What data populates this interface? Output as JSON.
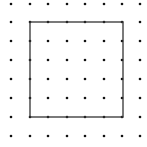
{
  "diagram": {
    "type": "dot-grid-with-square",
    "background": "#ffffff",
    "dot_color": "#111111",
    "line_color": "#333333",
    "grid": {
      "columns_x": [
        11,
        30,
        48,
        67,
        85,
        104,
        122,
        140
      ],
      "rows_y": [
        4,
        22,
        41,
        60,
        79,
        98,
        117,
        136
      ],
      "dot_radius": 1.3
    },
    "square": {
      "x1": 30,
      "y1": 22,
      "x2": 123,
      "y2": 117,
      "grid_units": 5,
      "stroke_width": 1.3
    }
  }
}
